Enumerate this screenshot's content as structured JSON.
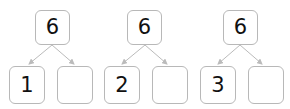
{
  "diagram": {
    "type": "number-bond",
    "colors": {
      "box_border": "#b8b8b8",
      "arrow": "#bbbbbb",
      "text": "#111111"
    },
    "bonds": [
      {
        "whole": "6",
        "part_left": "1",
        "part_right": ""
      },
      {
        "whole": "6",
        "part_left": "2",
        "part_right": ""
      },
      {
        "whole": "6",
        "part_left": "3",
        "part_right": ""
      }
    ]
  }
}
